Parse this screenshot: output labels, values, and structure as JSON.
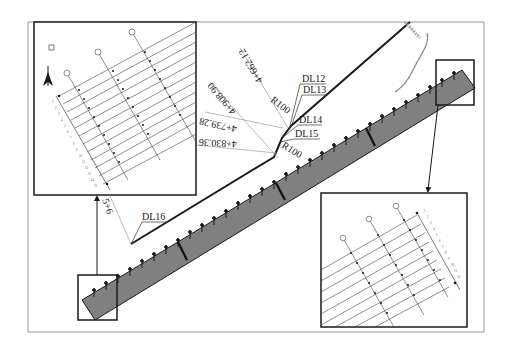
{
  "diagram": {
    "type": "engineering-plan",
    "colors": {
      "background": "#ffffff",
      "frame": "#9a9a9a",
      "ink": "#1a1a1a",
      "structure_fill": "#3a3a3a",
      "leader": "#aaaaaa"
    }
  },
  "labels": {
    "dl12": "DL12",
    "dl13": "DL13",
    "dl14": "DL14",
    "dl15": "DL15",
    "dl16": "DL16",
    "r100_top": "R100",
    "r100_bottom": "R100"
  },
  "stations": {
    "s1": "4+662.12",
    "s2": "4+908.90",
    "s3": "4+739.28",
    "s4": "4+830.36",
    "s5": "5+6"
  },
  "insets": {
    "top_left": {
      "name": "detail-inset-upper-left",
      "grid_rows": 9,
      "grid_cols": 3,
      "row_labels": [
        "1",
        "2",
        "3",
        "4",
        "5",
        "6",
        "7",
        "8",
        "9",
        "10",
        "11",
        "12",
        "13",
        "14",
        "15"
      ]
    },
    "bottom_right": {
      "name": "detail-inset-lower-right",
      "grid_rows": 9,
      "grid_cols": 3
    }
  }
}
